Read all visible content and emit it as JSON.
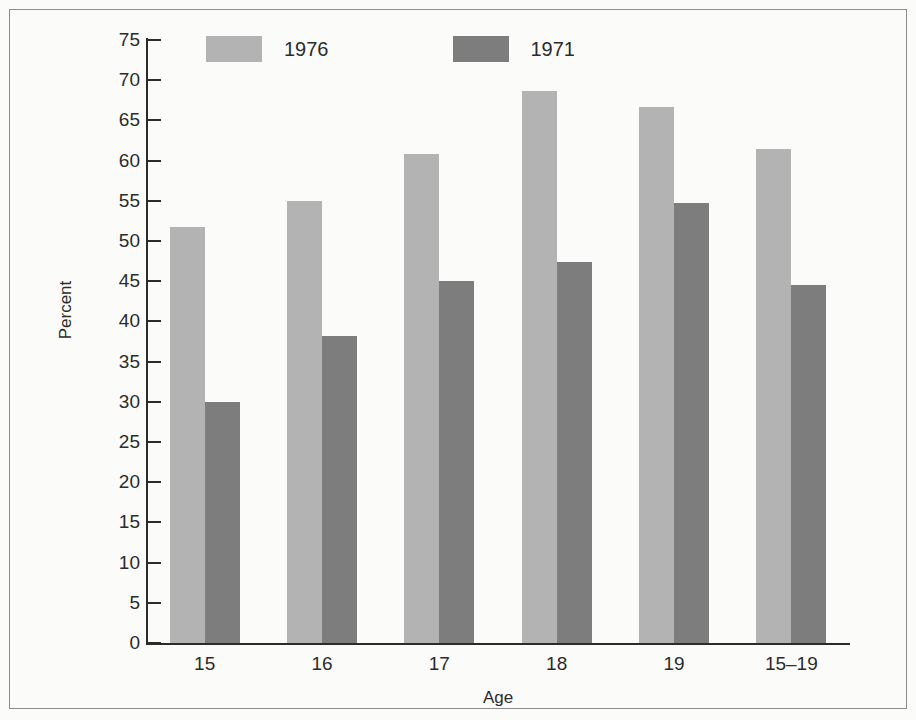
{
  "chart_data": {
    "type": "bar",
    "title": "",
    "subtitle": "",
    "xlabel": "Age",
    "ylabel": "Percent",
    "categories": [
      "15",
      "16",
      "17",
      "18",
      "19",
      "15–19"
    ],
    "series": [
      {
        "name": "1976",
        "color": "#b3b3b3",
        "values": [
          51.8,
          55.0,
          60.8,
          68.7,
          66.7,
          61.5
        ]
      },
      {
        "name": "1971",
        "color": "#7d7d7d",
        "values": [
          30.0,
          38.2,
          45.0,
          47.4,
          54.7,
          44.5
        ]
      }
    ],
    "ylim": [
      0,
      75
    ],
    "ytick_step": 5,
    "yticks": [
      0,
      5,
      10,
      15,
      20,
      25,
      30,
      35,
      40,
      45,
      50,
      55,
      60,
      65,
      70,
      75
    ],
    "ytick_labels": [
      "0",
      "5",
      "10",
      "15",
      "20",
      "25",
      "30",
      "35",
      "40",
      "45",
      "50",
      "55",
      "60",
      "65",
      "70",
      "75"
    ],
    "grid": false,
    "legend_position": "top-left-inside",
    "bar_group_style": "adjacent-pairs",
    "annotations": []
  },
  "legend": {
    "entries": [
      {
        "label": "1976"
      },
      {
        "label": "1971"
      }
    ]
  },
  "axes": {
    "y_title": "Percent",
    "x_title": "Age"
  },
  "colors": {
    "series_1976": "#b3b3b3",
    "series_1971": "#7d7d7d",
    "axis": "#2b2b2b",
    "frame_border": "#8c8c8c",
    "background": "#fbfbfa"
  }
}
